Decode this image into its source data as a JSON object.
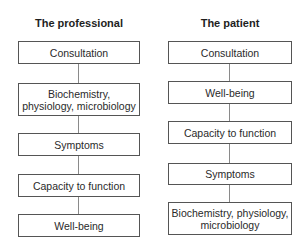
{
  "diagram": {
    "type": "comparison-flowchart",
    "columns": [
      {
        "title": "The professional",
        "boxes": [
          "Consultation",
          "Biochemistry, physiology, microbiology",
          "Symptoms",
          "Capacity to function",
          "Well-being"
        ]
      },
      {
        "title": "The patient",
        "boxes": [
          "Consultation",
          "Well-being",
          "Capacity to function",
          "Symptoms",
          "Biochemistry, physiology, microbiology"
        ]
      }
    ],
    "colors": {
      "box_border": "#555555",
      "connector": "#8a8a8a",
      "text": "#2a2a2a",
      "background": "#ffffff"
    }
  }
}
